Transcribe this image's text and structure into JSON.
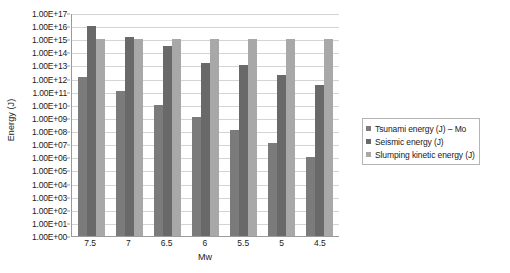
{
  "chart_data": {
    "type": "bar",
    "title": "",
    "xlabel": "Mw",
    "ylabel": "Energy (J)",
    "categories": [
      "7.5",
      "7",
      "6.5",
      "6",
      "5.5",
      "5",
      "4.5"
    ],
    "yscale": "log",
    "ylim": [
      1,
      1e+17
    ],
    "ytick_labels": [
      "1.00E+17",
      "1.00E+16",
      "1.00E+15",
      "1.00E+14",
      "1.00E+13",
      "1.00E+12",
      "1.00E+11",
      "1.00E+10",
      "1.00E+09",
      "1.00E+08",
      "1.00E+07",
      "1.00E+06",
      "1.00E+05",
      "1.00E+04",
      "1.00E+03",
      "1.00E+02",
      "1.00E+01",
      "1.00E+00"
    ],
    "ytick_exponents": [
      17,
      16,
      15,
      14,
      13,
      12,
      11,
      10,
      9,
      8,
      7,
      6,
      5,
      4,
      3,
      2,
      1,
      0
    ],
    "grid": true,
    "legend_position": "right",
    "series": [
      {
        "name": "Tsunami energy (J) – Mo",
        "color": "#7b7b7b",
        "log_values": [
          12.1,
          11.05,
          10.0,
          9.05,
          8.1,
          7.1,
          6.0
        ],
        "values": [
          1260000000000.0,
          112000000000.0,
          10000000000.0,
          1120000000.0,
          126000000.0,
          12600000.0,
          1000000.0
        ]
      },
      {
        "name": "Seismic energy (J)",
        "color": "#696969",
        "log_values": [
          16.0,
          15.2,
          14.5,
          13.2,
          13.0,
          12.25,
          11.55
        ],
        "values": [
          1e+16,
          1580000000000000.0,
          316000000000000.0,
          15800000000000.0,
          10000000000000.0,
          1780000000000.0,
          355000000000.0
        ]
      },
      {
        "name": "Slumping kinetic energy (J)",
        "color": "#a8a8a8",
        "log_values": [
          15.0,
          15.0,
          15.0,
          15.0,
          15.0,
          15.0,
          15.0
        ],
        "values": [
          1000000000000000.0,
          1000000000000000.0,
          1000000000000000.0,
          1000000000000000.0,
          1000000000000000.0,
          1000000000000000.0,
          1000000000000000.0
        ]
      }
    ]
  },
  "legend": {
    "items": [
      {
        "label": "Tsunami energy (J) – Mo"
      },
      {
        "label": "Seismic energy (J)"
      },
      {
        "label": "Slumping kinetic energy (J)"
      }
    ]
  }
}
